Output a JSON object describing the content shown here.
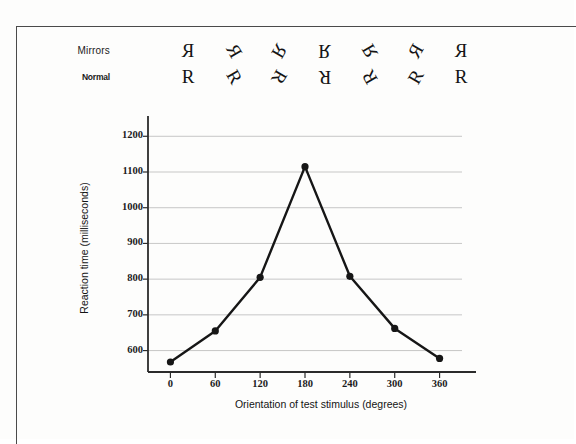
{
  "figure": {
    "stimulus_rows": [
      {
        "name": "mirrors",
        "label": "Mirrors",
        "mirrored": true,
        "glyph": "R",
        "angles": [
          0,
          60,
          120,
          180,
          240,
          300,
          360
        ]
      },
      {
        "name": "normal",
        "label": "Normal",
        "mirrored": false,
        "glyph": "R",
        "angles": [
          0,
          60,
          120,
          180,
          240,
          300,
          360
        ]
      }
    ]
  },
  "chart_data": {
    "type": "line",
    "title": "",
    "xlabel": "Orientation of test stimulus (degrees)",
    "ylabel": "Reaction time (milliseconds)",
    "x": [
      0,
      60,
      120,
      180,
      240,
      300,
      360
    ],
    "values": [
      568,
      655,
      805,
      1115,
      808,
      662,
      578
    ],
    "xtick_labels": [
      "0",
      "60",
      "120",
      "180",
      "240",
      "300",
      "360"
    ],
    "ytick_labels": [
      "600",
      "700",
      "800",
      "900",
      "1000",
      "1100",
      "1200"
    ],
    "yticks": [
      600,
      700,
      800,
      900,
      1000,
      1100,
      1200
    ],
    "xlim": [
      -30,
      390
    ],
    "ylim": [
      540,
      1240
    ],
    "grid": "horizontal",
    "legend": "none",
    "marker": "filled-circle",
    "line_color": "#161616",
    "grid_color": "#b9b9b9",
    "axis_color": "#2b2b2b"
  }
}
